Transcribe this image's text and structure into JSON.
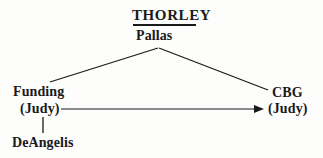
{
  "diagram": {
    "type": "relationship-tree",
    "title": "THORLEY",
    "root": {
      "label": "Pallas"
    },
    "nodes": [
      {
        "id": "funding",
        "name": "Funding",
        "sub": "(Judy)"
      },
      {
        "id": "deangelis",
        "name": "DeAngelis"
      },
      {
        "id": "cbg",
        "name": "CBG",
        "sub": "(Judy)"
      }
    ],
    "colors": {
      "ink": "#1a1a1a",
      "background": "#fdfdfc"
    }
  }
}
